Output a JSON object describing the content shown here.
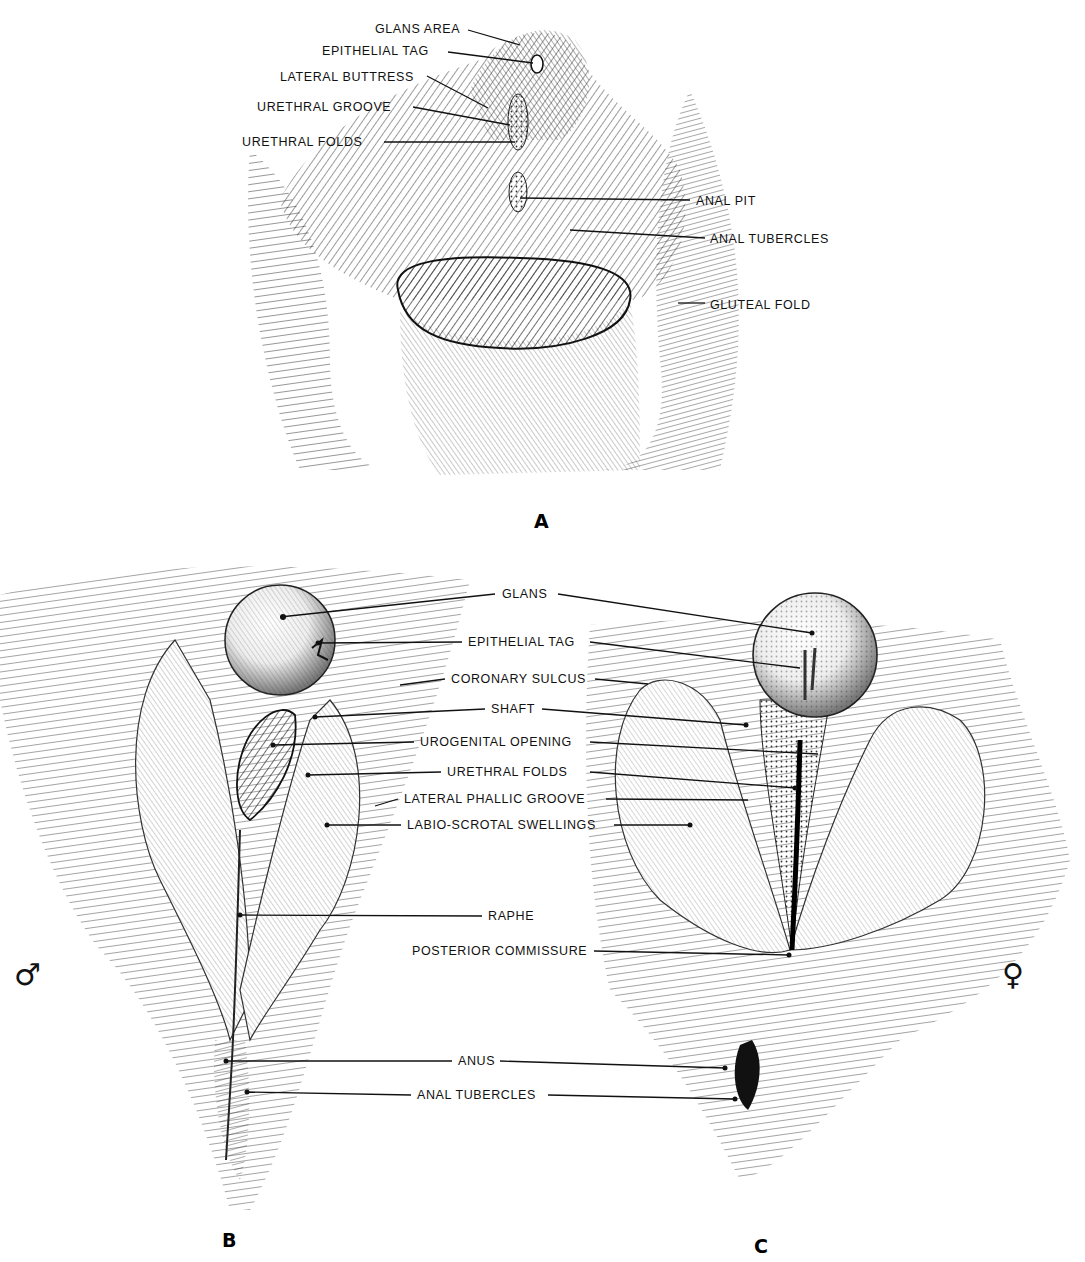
{
  "figure": {
    "panels": [
      {
        "id": "A",
        "letter": "A",
        "letter_pos": [
          534,
          528
        ],
        "labels": [
          {
            "text": "GLANS AREA",
            "x": 375,
            "y": 33,
            "anchor": "start",
            "line": [
              [
                468,
                30
              ],
              [
                520,
                45
              ]
            ]
          },
          {
            "text": "EPITHELIAL TAG",
            "x": 322,
            "y": 55,
            "anchor": "start",
            "line": [
              [
                448,
                52
              ],
              [
                533,
                63
              ]
            ]
          },
          {
            "text": "LATERAL BUTTRESS",
            "x": 280,
            "y": 81,
            "anchor": "start",
            "line": [
              [
                427,
                76
              ],
              [
                488,
                108
              ]
            ]
          },
          {
            "text": "URETHRAL GROOVE",
            "x": 257,
            "y": 111,
            "anchor": "start",
            "line": [
              [
                413,
                107
              ],
              [
                510,
                125
              ]
            ]
          },
          {
            "text": "URETHRAL FOLDS",
            "x": 242,
            "y": 146,
            "anchor": "start",
            "line": [
              [
                384,
                142
              ],
              [
                515,
                142
              ]
            ]
          },
          {
            "text": "ANAL PIT",
            "x": 696,
            "y": 205,
            "anchor": "start",
            "line": [
              [
                690,
                200
              ],
              [
                520,
                198
              ]
            ]
          },
          {
            "text": "ANAL TUBERCLES",
            "x": 710,
            "y": 243,
            "anchor": "start",
            "line": [
              [
                705,
                238
              ],
              [
                570,
                230
              ]
            ]
          },
          {
            "text": "GLUTEAL FOLD",
            "x": 710,
            "y": 309,
            "anchor": "start",
            "line": [
              [
                705,
                303
              ],
              [
                678,
                303
              ]
            ]
          }
        ]
      },
      {
        "id": "B",
        "letter": "B",
        "letter_pos": [
          222,
          1247
        ],
        "sex_symbol": "♂",
        "sex_symbol_pos": [
          14,
          985
        ]
      },
      {
        "id": "C",
        "letter": "C",
        "letter_pos": [
          754,
          1253
        ],
        "sex_symbol": "♀",
        "sex_symbol_pos": [
          1002,
          985
        ]
      }
    ],
    "shared_labels": [
      {
        "text": "GLANS",
        "x": 502,
        "y": 598,
        "anchor": "start",
        "lines": [
          [
            [
              495,
              594
            ],
            [
              280,
              617
            ]
          ],
          [
            [
              558,
              594
            ],
            [
              812,
              633
            ]
          ]
        ]
      },
      {
        "text": "EPITHELIAL TAG",
        "x": 468,
        "y": 646,
        "anchor": "start",
        "lines": [
          [
            [
              462,
              642
            ],
            [
              318,
              643
            ]
          ],
          [
            [
              590,
              642
            ],
            [
              800,
              668
            ]
          ]
        ]
      },
      {
        "text": "CORONARY SULCUS",
        "x": 451,
        "y": 683,
        "anchor": "start",
        "lines": [
          [
            [
              445,
              679
            ],
            [
              400,
              685
            ]
          ],
          [
            [
              595,
              679
            ],
            [
              648,
              684
            ]
          ]
        ]
      },
      {
        "text": "SHAFT",
        "x": 491,
        "y": 713,
        "anchor": "start",
        "lines": [
          [
            [
              485,
              709
            ],
            [
              315,
              717
            ]
          ],
          [
            [
              542,
              709
            ],
            [
              746,
              725
            ]
          ]
        ]
      },
      {
        "text": "UROGENITAL OPENING",
        "x": 420,
        "y": 746,
        "anchor": "start",
        "lines": [
          [
            [
              414,
              742
            ],
            [
              273,
              745
            ]
          ],
          [
            [
              590,
              742
            ],
            [
              818,
              754
            ]
          ]
        ]
      },
      {
        "text": "URETHRAL FOLDS",
        "x": 447,
        "y": 776,
        "anchor": "start",
        "lines": [
          [
            [
              441,
              772
            ],
            [
              308,
              775
            ]
          ],
          [
            [
              590,
              772
            ],
            [
              795,
              788
            ]
          ]
        ]
      },
      {
        "text": "LATERAL PHALLIC GROOVE",
        "x": 404,
        "y": 803,
        "anchor": "start",
        "lines": [
          [
            [
              398,
              799
            ],
            [
              375,
              806
            ]
          ],
          [
            [
              606,
              799
            ],
            [
              748,
              800
            ]
          ]
        ]
      },
      {
        "text": "LABIO-SCROTAL SWELLINGS",
        "x": 407,
        "y": 829,
        "anchor": "start",
        "lines": [
          [
            [
              401,
              825
            ],
            [
              327,
              825
            ]
          ],
          [
            [
              614,
              825
            ],
            [
              690,
              825
            ]
          ]
        ]
      },
      {
        "text": "RAPHE",
        "x": 488,
        "y": 920,
        "anchor": "start",
        "lines": [
          [
            [
              482,
              916
            ],
            [
              240,
              915
            ]
          ]
        ]
      },
      {
        "text": "POSTERIOR COMMISSURE",
        "x": 412,
        "y": 955,
        "anchor": "start",
        "lines": [
          [
            [
              594,
              951
            ],
            [
              789,
              955
            ]
          ]
        ]
      },
      {
        "text": "ANUS",
        "x": 458,
        "y": 1065,
        "anchor": "start",
        "lines": [
          [
            [
              452,
              1061
            ],
            [
              226,
              1061
            ]
          ],
          [
            [
              500,
              1061
            ],
            [
              725,
              1068
            ]
          ]
        ]
      },
      {
        "text": "ANAL TUBERCLES",
        "x": 417,
        "y": 1099,
        "anchor": "start",
        "lines": [
          [
            [
              411,
              1095
            ],
            [
              247,
              1092
            ]
          ],
          [
            [
              548,
              1095
            ],
            [
              735,
              1099
            ]
          ]
        ]
      }
    ]
  }
}
